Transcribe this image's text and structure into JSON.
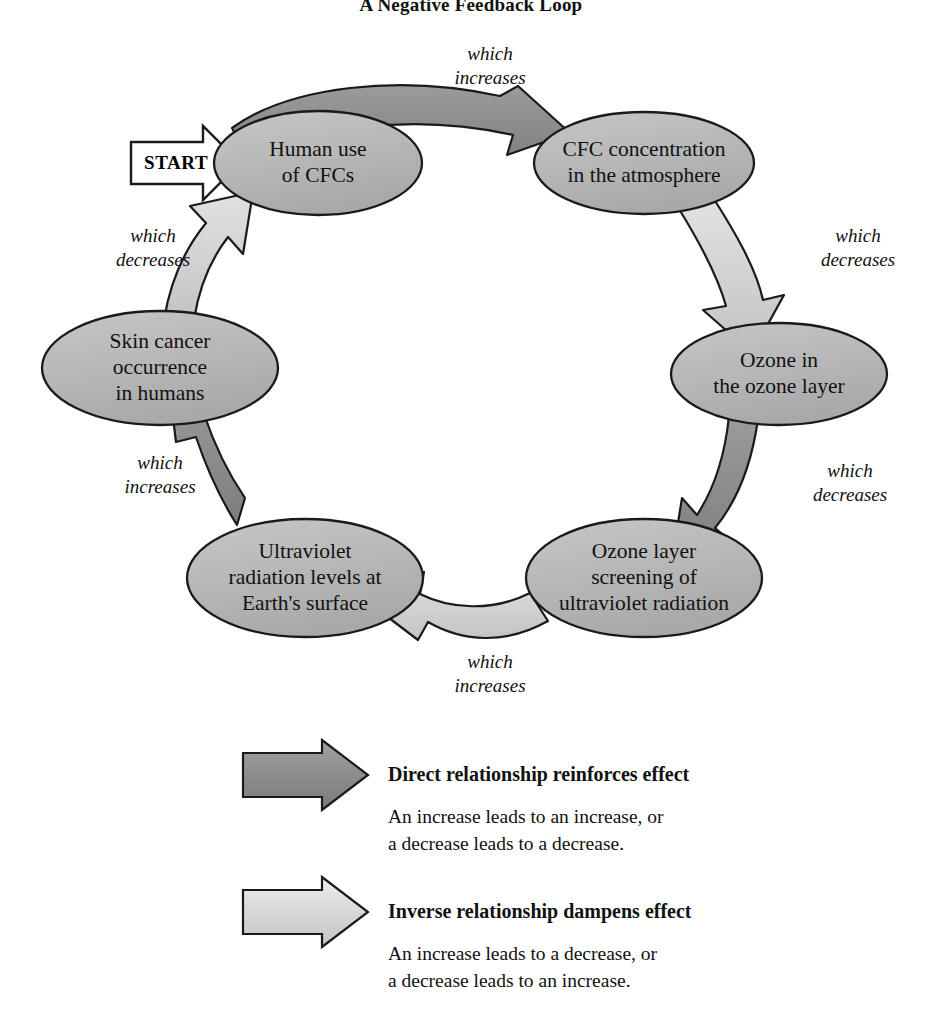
{
  "title": "A Negative Feedback Loop",
  "start_marker": {
    "label": "START"
  },
  "colors": {
    "node_fill": "#b9b9b9",
    "node_stroke": "#1a1a1a",
    "arrow_direct_fill": "#8e8e8e",
    "arrow_inverse_fill": "#d2d2d2",
    "arrow_stroke": "#1a1a1a",
    "text": "#111111",
    "background": "#ffffff"
  },
  "nodes": [
    {
      "id": "human-use-of-cfcs",
      "label": "Human use\nof CFCs"
    },
    {
      "id": "cfc-concentration",
      "label": "CFC concentration\nin the atmosphere"
    },
    {
      "id": "ozone-in-layer",
      "label": "Ozone in\nthe ozone layer"
    },
    {
      "id": "ozone-screening",
      "label": "Ozone layer\nscreening of\nultraviolet radiation"
    },
    {
      "id": "uv-radiation-levels",
      "label": "Ultraviolet\nradiation levels at\nEarth's surface"
    },
    {
      "id": "skin-cancer",
      "label": "Skin cancer\noccurrence\nin humans"
    }
  ],
  "edges": [
    {
      "id": "edge-human-to-cfc",
      "from": "human-use-of-cfcs",
      "to": "cfc-concentration",
      "label": "which\nincreases",
      "relationship": "direct"
    },
    {
      "id": "edge-cfc-to-ozone",
      "from": "cfc-concentration",
      "to": "ozone-in-layer",
      "label": "which\ndecreases",
      "relationship": "inverse"
    },
    {
      "id": "edge-ozone-to-screening",
      "from": "ozone-in-layer",
      "to": "ozone-screening",
      "label": "which\ndecreases",
      "relationship": "direct"
    },
    {
      "id": "edge-screening-to-uv",
      "from": "ozone-screening",
      "to": "uv-radiation-levels",
      "label": "which\nincreases",
      "relationship": "inverse"
    },
    {
      "id": "edge-uv-to-skin-cancer",
      "from": "uv-radiation-levels",
      "to": "skin-cancer",
      "label": "which\nincreases",
      "relationship": "direct"
    },
    {
      "id": "edge-skin-cancer-to-human",
      "from": "skin-cancer",
      "to": "human-use-of-cfcs",
      "label": "which\ndecreases",
      "relationship": "inverse"
    }
  ],
  "legend": [
    {
      "id": "legend-direct",
      "title": "Direct relationship reinforces effect",
      "description": "An increase leads to an increase, or\na decrease leads to a decrease.",
      "arrow_style": "direct"
    },
    {
      "id": "legend-inverse",
      "title": "Inverse relationship dampens effect",
      "description": "An increase leads to a decrease, or\na decrease leads to an increase.",
      "arrow_style": "inverse"
    }
  ]
}
